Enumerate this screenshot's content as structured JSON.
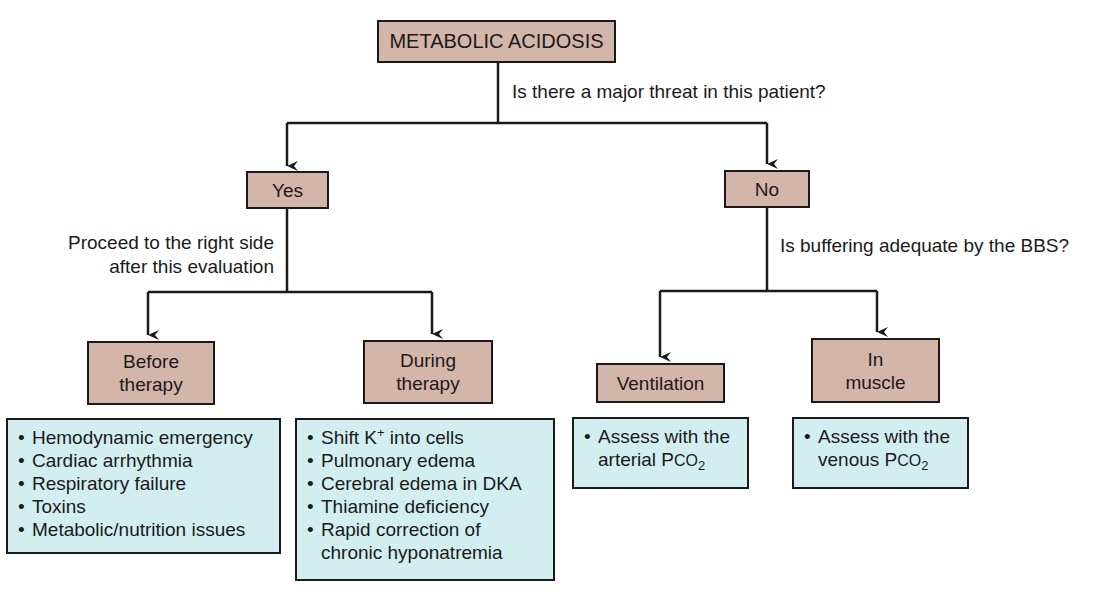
{
  "diagram": {
    "type": "decision-flowchart",
    "colors": {
      "decision_box_fill": "#d4b5a9",
      "list_box_fill": "#d3eef0",
      "line": "#1a1a1a"
    },
    "root": {
      "label": "METABOLIC ACIDOSIS"
    },
    "root_question": "Is there a major threat in this patient?",
    "yes_branch": {
      "label": "Yes",
      "note_line1": "Proceed to the right side",
      "note_line2": "after this evaluation",
      "before": {
        "label_line1": "Before",
        "label_line2": "therapy",
        "items": [
          "Hemodynamic emergency",
          "Cardiac arrhythmia",
          "Respiratory failure",
          "Toxins",
          "Metabolic/nutrition issues"
        ]
      },
      "during": {
        "label_line1": "During",
        "label_line2": "therapy",
        "item1_prefix": "Shift K",
        "item1_sup": "+",
        "item1_suffix": " into cells",
        "items": [
          "Pulmonary edema",
          "Cerebral edema in DKA",
          "Thiamine deficiency"
        ],
        "last_item_line1": "Rapid correction of",
        "last_item_line2": "chronic hyponatremia"
      }
    },
    "no_branch": {
      "label": "No",
      "question": "Is buffering adequate by the BBS?",
      "ventilation": {
        "label": "Ventilation",
        "line1": "Assess with the",
        "line2_prefix": "arterial P",
        "line2_gas": "CO",
        "line2_sub": "2"
      },
      "muscle": {
        "label_line1": "In",
        "label_line2": "muscle",
        "line1": "Assess with the",
        "line2_prefix": "venous P",
        "line2_gas": "CO",
        "line2_sub": "2"
      }
    },
    "bullet": "•"
  }
}
